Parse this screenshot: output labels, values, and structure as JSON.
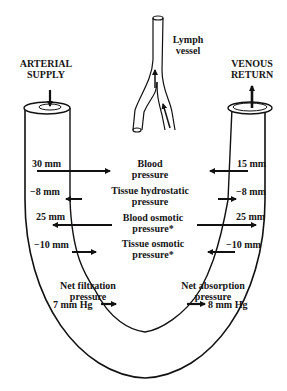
{
  "labels": {
    "arterial_line1": "ARTERIAL",
    "arterial_line2": "SUPPLY",
    "venous_line1": "VENOUS",
    "venous_line2": "RETURN",
    "lymph_line1": "Lymph",
    "lymph_line2": "vessel"
  },
  "forces": [
    {
      "name_line1": "Blood",
      "name_line2": "pressure",
      "arterial": "30 mm",
      "venous": "15 mm"
    },
    {
      "name_line1": "Tissue hydrostatic",
      "name_line2": "pressure",
      "arterial": "−8 mm",
      "venous": "−8 mm"
    },
    {
      "name_line1": "Blood osmotic",
      "name_line2": "pressure*",
      "arterial": "25 mm",
      "venous": "25 mm"
    },
    {
      "name_line1": "Tissue osmotic",
      "name_line2": "pressure*",
      "arterial": "−10 mm",
      "venous": "−10 mm"
    }
  ],
  "net": {
    "filtration_line1": "Net filtration",
    "filtration_line2": "pressure",
    "filtration_value": "7 mm Hg",
    "absorption_line1": "Net absorption",
    "absorption_line2": "pressure",
    "absorption_value": "8 mm Hg"
  }
}
